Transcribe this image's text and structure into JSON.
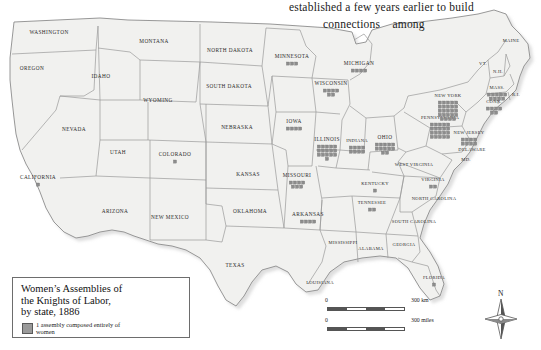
{
  "page": {
    "caption_line1": "established a few years earlier to build",
    "caption_line2": "connections    among"
  },
  "legend": {
    "title": "Women’s Assemblies of\nthe Knights of Labor,\nby state, 1886",
    "entry_label": "1 assembly composed entirely of\nwomen",
    "swatch_color": "#9a9a9a"
  },
  "scale": {
    "km_zero": "0",
    "km_label": "300 km",
    "mi_zero": "0",
    "mi_label": "300 miles"
  },
  "compass": {
    "letter": "N"
  },
  "map": {
    "ocean_color": "#ffffff",
    "land_color": "#f1f1ef",
    "border_color": "#8c8c8c",
    "marker_color": "#8d8d8d",
    "states": [
      {
        "name": "WASHINGTON",
        "x": 49,
        "y": 33,
        "size": "sm",
        "markers": 0
      },
      {
        "name": "OREGON",
        "x": 32,
        "y": 69,
        "size": "sm",
        "markers": 0
      },
      {
        "name": "IDAHO",
        "x": 101,
        "y": 77,
        "size": "sm",
        "markers": 0
      },
      {
        "name": "MONTANA",
        "x": 154,
        "y": 42,
        "size": "sm",
        "markers": 0
      },
      {
        "name": "NORTH DAKOTA",
        "x": 230,
        "y": 51,
        "size": "sm",
        "markers": 0
      },
      {
        "name": "MINNESOTA",
        "x": 292,
        "y": 57,
        "size": "sm",
        "markers": 3
      },
      {
        "name": "WISCONSIN",
        "x": 331,
        "y": 84,
        "size": "sm",
        "markers": 6
      },
      {
        "name": "MICHIGAN",
        "x": 359,
        "y": 64,
        "size": "sm",
        "markers": 4
      },
      {
        "name": "SOUTH DAKOTA",
        "x": 229,
        "y": 87,
        "size": "sm",
        "markers": 0
      },
      {
        "name": "WYOMING",
        "x": 158,
        "y": 101,
        "size": "sm",
        "markers": 0
      },
      {
        "name": "NEBRASKA",
        "x": 237,
        "y": 128,
        "size": "sm",
        "markers": 0
      },
      {
        "name": "IOWA",
        "x": 294,
        "y": 122,
        "size": "sm",
        "markers": 4
      },
      {
        "name": "ILLINOIS",
        "x": 327,
        "y": 140,
        "size": "sm",
        "markers": 16
      },
      {
        "name": "INDIANA",
        "x": 357,
        "y": 141,
        "size": "xs",
        "markers": 8
      },
      {
        "name": "OHIO",
        "x": 385,
        "y": 138,
        "size": "sm",
        "markers": 12
      },
      {
        "name": "PENNSYLVANIA",
        "x": 440,
        "y": 118,
        "size": "xs",
        "markers": 20
      },
      {
        "name": "NEW YORK",
        "x": 448,
        "y": 96,
        "size": "xs",
        "markers": 24
      },
      {
        "name": "MAINE",
        "x": 511,
        "y": 41,
        "size": "xs",
        "markers": 0
      },
      {
        "name": "VT.",
        "x": 483,
        "y": 64,
        "size": "xs",
        "markers": 0
      },
      {
        "name": "N.H.",
        "x": 498,
        "y": 72,
        "size": "xs",
        "markers": 0
      },
      {
        "name": "MASS.",
        "x": 497,
        "y": 88,
        "size": "xs",
        "markers": 9
      },
      {
        "name": "CONN.",
        "x": 494,
        "y": 102,
        "size": "xs",
        "markers": 6
      },
      {
        "name": "R.I.",
        "x": 516,
        "y": 95,
        "size": "xs",
        "markers": 0
      },
      {
        "name": "NEW JERSEY",
        "x": 469,
        "y": 133,
        "size": "xs",
        "markers": 8
      },
      {
        "name": "DELAWARE",
        "x": 472,
        "y": 150,
        "size": "xs",
        "markers": 0
      },
      {
        "name": "MD.",
        "x": 466,
        "y": 160,
        "size": "xs",
        "markers": 0
      },
      {
        "name": "WEST VIRGINIA",
        "x": 414,
        "y": 165,
        "size": "xs",
        "markers": 0
      },
      {
        "name": "VIRGINIA",
        "x": 433,
        "y": 180,
        "size": "xs",
        "markers": 2
      },
      {
        "name": "KENTUCKY",
        "x": 375,
        "y": 184,
        "size": "xs",
        "markers": 1
      },
      {
        "name": "TENNESSEE",
        "x": 372,
        "y": 203,
        "size": "xs",
        "markers": 2
      },
      {
        "name": "NORTH CAROLINA",
        "x": 434,
        "y": 199,
        "size": "xs",
        "markers": 0
      },
      {
        "name": "SOUTH CAROLINA",
        "x": 414,
        "y": 222,
        "size": "xs",
        "markers": 0
      },
      {
        "name": "GEORGIA",
        "x": 404,
        "y": 245,
        "size": "xs",
        "markers": 0
      },
      {
        "name": "ALABAMA",
        "x": 371,
        "y": 249,
        "size": "xs",
        "markers": 0
      },
      {
        "name": "MISSISSIPPI",
        "x": 343,
        "y": 243,
        "size": "xs",
        "markers": 0
      },
      {
        "name": "LOUISIANA",
        "x": 320,
        "y": 283,
        "size": "xs",
        "markers": 0
      },
      {
        "name": "ARKANSAS",
        "x": 308,
        "y": 215,
        "size": "sm",
        "markers": 4
      },
      {
        "name": "MISSOURI",
        "x": 297,
        "y": 176,
        "size": "sm",
        "markers": 7
      },
      {
        "name": "KANSAS",
        "x": 248,
        "y": 175,
        "size": "sm",
        "markers": 0
      },
      {
        "name": "OKLAHOMA",
        "x": 250,
        "y": 212,
        "size": "sm",
        "markers": 0
      },
      {
        "name": "TEXAS",
        "x": 235,
        "y": 266,
        "size": "sm",
        "markers": 0
      },
      {
        "name": "NEW MEXICO",
        "x": 170,
        "y": 218,
        "size": "sm",
        "markers": 0
      },
      {
        "name": "ARIZONA",
        "x": 115,
        "y": 212,
        "size": "sm",
        "markers": 0
      },
      {
        "name": "COLORADO",
        "x": 175,
        "y": 155,
        "size": "sm",
        "markers": 1
      },
      {
        "name": "UTAH",
        "x": 118,
        "y": 153,
        "size": "sm",
        "markers": 0
      },
      {
        "name": "NEVADA",
        "x": 74,
        "y": 130,
        "size": "sm",
        "markers": 0
      },
      {
        "name": "CALIFORNIA",
        "x": 38,
        "y": 178,
        "size": "sm",
        "markers": 1
      },
      {
        "name": "FLORIDA",
        "x": 434,
        "y": 278,
        "size": "xs",
        "markers": 1
      }
    ]
  }
}
